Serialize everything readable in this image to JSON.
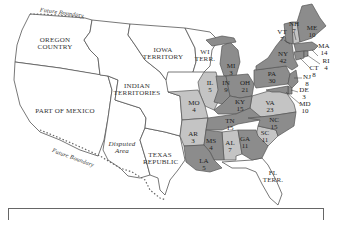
{
  "map": {
    "colors": {
      "whig": "#8c8c8c",
      "democrat": "#c4c4c4",
      "territory": "#ffffff",
      "border": "#555555"
    },
    "regions": [
      {
        "id": "oregon",
        "label": "OREGON COUNTRY",
        "x": 55,
        "y": 44
      },
      {
        "id": "iowa",
        "label": "IOWA TERRITORY",
        "x": 165,
        "y": 62
      },
      {
        "id": "wi",
        "label": "WI TERR.",
        "x": 205,
        "y": 57
      },
      {
        "id": "indian",
        "label": "INDIAN TERRITORIES",
        "x": 133,
        "y": 90
      },
      {
        "id": "mexico",
        "label": "PART OF MEXICO",
        "x": 60,
        "y": 110
      },
      {
        "id": "disputed",
        "label": "Disputed Area",
        "x": 123,
        "y": 150
      },
      {
        "id": "texas",
        "label": "TEXAS REPUBLIC",
        "x": 160,
        "y": 159
      },
      {
        "id": "fl",
        "label": "FL TERR.",
        "x": 273,
        "y": 177
      }
    ],
    "boundary_labels": [
      {
        "id": "future-north",
        "label": "Future Boundary",
        "x": 60,
        "y": 15
      },
      {
        "id": "future-south",
        "label": "Future Boundary",
        "x": 75,
        "y": 156
      }
    ],
    "states": [
      {
        "abbr": "ME",
        "votes": "10",
        "x": 312,
        "y": 32,
        "party": "whig"
      },
      {
        "abbr": "NH",
        "votes": "7",
        "x": 294,
        "y": 28,
        "party": "democrat"
      },
      {
        "abbr": "VT",
        "votes": "7",
        "x": 282,
        "y": 36,
        "party": "whig"
      },
      {
        "abbr": "MA",
        "votes": "14",
        "x": 324,
        "y": 50,
        "party": "whig"
      },
      {
        "abbr": "RI",
        "votes": "4",
        "x": 326,
        "y": 65,
        "party": "whig"
      },
      {
        "abbr": "CT",
        "votes": "8",
        "x": 314,
        "y": 72,
        "party": "whig"
      },
      {
        "abbr": "NY",
        "votes": "42",
        "x": 283,
        "y": 58,
        "party": "whig"
      },
      {
        "abbr": "NJ",
        "votes": "8",
        "x": 307,
        "y": 81,
        "party": "whig"
      },
      {
        "abbr": "DE",
        "votes": "3",
        "x": 304,
        "y": 94,
        "party": "whig"
      },
      {
        "abbr": "MD",
        "votes": "10",
        "x": 305,
        "y": 108,
        "party": "whig"
      },
      {
        "abbr": "PA",
        "votes": "30",
        "x": 272,
        "y": 78,
        "party": "whig"
      },
      {
        "abbr": "VA",
        "votes": "23",
        "x": 270,
        "y": 107,
        "party": "democrat"
      },
      {
        "abbr": "NC",
        "votes": "15",
        "x": 274,
        "y": 124,
        "party": "whig"
      },
      {
        "abbr": "SC",
        "votes": "11",
        "x": 265,
        "y": 137,
        "party": "democrat"
      },
      {
        "abbr": "GA",
        "votes": "11",
        "x": 245,
        "y": 143,
        "party": "whig"
      },
      {
        "abbr": "AL",
        "votes": "7",
        "x": 230,
        "y": 147,
        "party": "democrat"
      },
      {
        "abbr": "MS",
        "votes": "4",
        "x": 211,
        "y": 145,
        "party": "whig"
      },
      {
        "abbr": "LA",
        "votes": "5",
        "x": 204,
        "y": 165,
        "party": "whig"
      },
      {
        "abbr": "AR",
        "votes": "3",
        "x": 193,
        "y": 138,
        "party": "democrat"
      },
      {
        "abbr": "TN",
        "votes": "15",
        "x": 230,
        "y": 125,
        "party": "whig"
      },
      {
        "abbr": "KY",
        "votes": "15",
        "x": 240,
        "y": 106,
        "party": "whig"
      },
      {
        "abbr": "OH",
        "votes": "21",
        "x": 245,
        "y": 87,
        "party": "whig"
      },
      {
        "abbr": "IN",
        "votes": "9",
        "x": 226,
        "y": 87,
        "party": "whig"
      },
      {
        "abbr": "IL",
        "votes": "5",
        "x": 210,
        "y": 87,
        "party": "democrat"
      },
      {
        "abbr": "MO",
        "votes": "4",
        "x": 194,
        "y": 107,
        "party": "democrat"
      },
      {
        "abbr": "MI",
        "votes": "3",
        "x": 231,
        "y": 70,
        "party": "whig"
      }
    ]
  }
}
